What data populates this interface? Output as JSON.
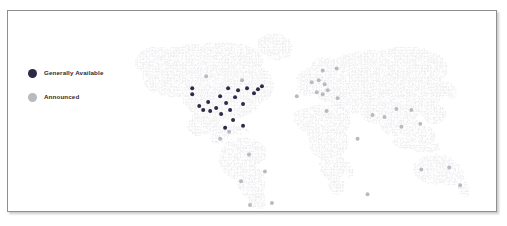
{
  "card": {
    "border_color": "#8e8e93",
    "background": "#ffffff"
  },
  "legend": {
    "items": [
      {
        "label": "Generally Available",
        "color": "#2e2a45",
        "icon": "filled-circle-icon"
      },
      {
        "label": "Announced",
        "color": "#b9b9c1",
        "icon": "filled-circle-icon"
      }
    ]
  },
  "map": {
    "projection": "equirectangular",
    "land_color": "#e9e9ec",
    "ocean_color": "#ffffff",
    "style": "dot-density"
  },
  "chart_data": {
    "type": "scatter",
    "title": "",
    "xlabel": "",
    "ylabel": "",
    "map_type": "world-point-map",
    "xlim": [
      0,
      490
    ],
    "ylim": [
      0,
      202
    ],
    "grid": false,
    "legend_position": "top-left",
    "series": [
      {
        "name": "Generally Available",
        "color": "#2e2a45",
        "count": 22,
        "points": [
          {
            "x": 185,
            "y": 78,
            "r": 2.0
          },
          {
            "x": 185,
            "y": 84,
            "r": 2.0
          },
          {
            "x": 192,
            "y": 96,
            "r": 2.0
          },
          {
            "x": 196,
            "y": 100,
            "r": 2.0
          },
          {
            "x": 201,
            "y": 92,
            "r": 2.0
          },
          {
            "x": 203,
            "y": 101,
            "r": 2.0
          },
          {
            "x": 209,
            "y": 98,
            "r": 2.0
          },
          {
            "x": 213,
            "y": 86,
            "r": 2.0
          },
          {
            "x": 214,
            "y": 104,
            "r": 2.0
          },
          {
            "x": 219,
            "y": 93,
            "r": 2.0
          },
          {
            "x": 221,
            "y": 78,
            "r": 2.0
          },
          {
            "x": 223,
            "y": 100,
            "r": 2.0
          },
          {
            "x": 228,
            "y": 87,
            "r": 2.0
          },
          {
            "x": 231,
            "y": 80,
            "r": 2.0
          },
          {
            "x": 226,
            "y": 110,
            "r": 2.0
          },
          {
            "x": 236,
            "y": 94,
            "r": 2.0
          },
          {
            "x": 240,
            "y": 78,
            "r": 2.0
          },
          {
            "x": 247,
            "y": 83,
            "r": 2.0
          },
          {
            "x": 251,
            "y": 79,
            "r": 2.0
          },
          {
            "x": 255,
            "y": 76,
            "r": 2.0
          },
          {
            "x": 236,
            "y": 116,
            "r": 2.0
          },
          {
            "x": 218,
            "y": 118,
            "r": 2.0
          }
        ]
      },
      {
        "name": "Announced",
        "color": "#b9b9c1",
        "count": 30,
        "points": [
          {
            "x": 199,
            "y": 66,
            "r": 2.0
          },
          {
            "x": 235,
            "y": 70,
            "r": 2.0
          },
          {
            "x": 213,
            "y": 129,
            "r": 2.0
          },
          {
            "x": 222,
            "y": 122,
            "r": 2.0
          },
          {
            "x": 242,
            "y": 145,
            "r": 2.0
          },
          {
            "x": 234,
            "y": 172,
            "r": 2.0
          },
          {
            "x": 258,
            "y": 162,
            "r": 2.0
          },
          {
            "x": 243,
            "y": 196,
            "r": 2.0
          },
          {
            "x": 265,
            "y": 194,
            "r": 2.0
          },
          {
            "x": 310,
            "y": 82,
            "r": 2.0
          },
          {
            "x": 305,
            "y": 72,
            "r": 2.0
          },
          {
            "x": 312,
            "y": 70,
            "r": 2.0
          },
          {
            "x": 318,
            "y": 74,
            "r": 2.0
          },
          {
            "x": 316,
            "y": 60,
            "r": 2.0
          },
          {
            "x": 316,
            "y": 84,
            "r": 2.0
          },
          {
            "x": 321,
            "y": 80,
            "r": 2.0
          },
          {
            "x": 330,
            "y": 58,
            "r": 2.0
          },
          {
            "x": 320,
            "y": 101,
            "r": 2.0
          },
          {
            "x": 290,
            "y": 86,
            "r": 2.0
          },
          {
            "x": 331,
            "y": 88,
            "r": 2.0
          },
          {
            "x": 351,
            "y": 129,
            "r": 2.0
          },
          {
            "x": 361,
            "y": 185,
            "r": 2.0
          },
          {
            "x": 366,
            "y": 105,
            "r": 2.0
          },
          {
            "x": 378,
            "y": 107,
            "r": 2.0
          },
          {
            "x": 390,
            "y": 99,
            "r": 2.0
          },
          {
            "x": 395,
            "y": 117,
            "r": 2.0
          },
          {
            "x": 405,
            "y": 100,
            "r": 2.0
          },
          {
            "x": 414,
            "y": 114,
            "r": 2.0
          },
          {
            "x": 415,
            "y": 160,
            "r": 2.0
          },
          {
            "x": 443,
            "y": 158,
            "r": 2.0
          },
          {
            "x": 454,
            "y": 176,
            "r": 2.0
          }
        ]
      }
    ]
  }
}
